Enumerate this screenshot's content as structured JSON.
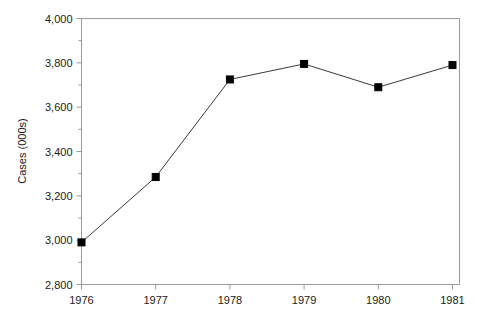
{
  "chart_data": {
    "type": "line",
    "title": "",
    "xlabel": "",
    "ylabel": "Cases (000s)",
    "categories": [
      "1976",
      "1977",
      "1978",
      "1979",
      "1980",
      "1981"
    ],
    "x": [
      1976,
      1977,
      1978,
      1979,
      1980,
      1981
    ],
    "values": [
      2990,
      3285,
      3725,
      3795,
      3690,
      3790
    ],
    "series": [
      {
        "name": "Cases",
        "values": [
          2990,
          3285,
          3725,
          3795,
          3690,
          3790
        ]
      }
    ],
    "ylim": [
      2800,
      4000
    ],
    "ytick_values": [
      2800,
      3000,
      3200,
      3400,
      3600,
      3800,
      4000
    ],
    "ytick_labels": [
      "2,800",
      "3,000",
      "3,200",
      "3,400",
      "3,600",
      "3,800",
      "4,000"
    ],
    "yminor_step": 100,
    "xtick_labels": [
      "1976",
      "1977",
      "1978",
      "1979",
      "1980",
      "1981"
    ],
    "grid": false,
    "legend": false,
    "legend_position": "none",
    "marker": "square",
    "line_color": "#3a3a3a",
    "marker_color": "#000000",
    "axis_color": "#9a9a9a",
    "background_color": "#ffffff",
    "text_color": "#1a1a1a"
  },
  "axes": {
    "y_title": "Cases (000s)"
  }
}
